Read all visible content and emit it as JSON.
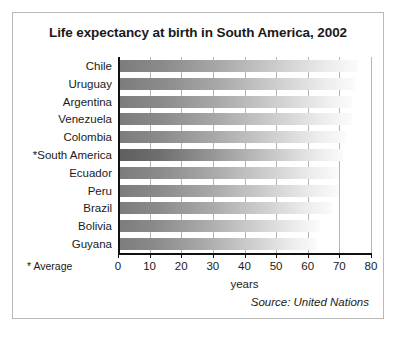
{
  "title": "Life expectancy at birth in South America, 2002",
  "footnote": "* Average",
  "source": "Source: United Nations",
  "chart_data": {
    "type": "bar",
    "orientation": "horizontal",
    "title": "Life expectancy at birth in South America, 2002",
    "xlabel": "years",
    "ylabel": "",
    "xlim": [
      0,
      80
    ],
    "xticks": [
      0,
      10,
      20,
      30,
      40,
      50,
      60,
      70,
      80
    ],
    "xtick_labels": [
      "0",
      "10",
      "20",
      "30",
      "40",
      "50",
      "60",
      "70",
      "80"
    ],
    "grid": true,
    "legend": false,
    "categories": [
      "Chile",
      "Uruguay",
      "Argentina",
      "Venezuela",
      "Colombia",
      "*South America",
      "Ecuador",
      "Peru",
      "Brazil",
      "Bolivia",
      "Guyana"
    ],
    "values": [
      76,
      75,
      74,
      74,
      72,
      71,
      70,
      70,
      68,
      64,
      63
    ],
    "highlight_index": 5,
    "annotations": [
      "* Average",
      "Source: United Nations"
    ],
    "bar_fill": "linear-gradient dark-gray to white",
    "colors": {
      "bar_start": "#7c7c7c",
      "bar_end": "#fbfbfb",
      "average_bar_start": "#5e5e5e",
      "axis": "#111111",
      "gridline": "#b5b5b5",
      "frame": "#b8b8b8",
      "text": "#1a1a1a",
      "background": "#ffffff"
    }
  }
}
